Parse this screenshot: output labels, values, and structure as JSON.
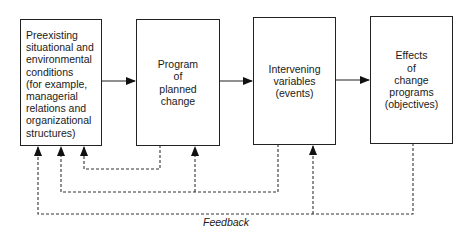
{
  "diagram": {
    "type": "flowchart",
    "boxes": [
      {
        "id": "preexisting-conditions",
        "label": "Preexisting\nsituational and\nenvironmental\n  conditions\n  (for example,\n  managerial\n  relations and\n  organizational\n  structures)"
      },
      {
        "id": "program-of-planned-change",
        "label": "Program\nof\nplanned\nchange"
      },
      {
        "id": "intervening-variables",
        "label": "Intervening\nvariables\n(events)"
      },
      {
        "id": "effects-of-change-programs",
        "label": "Effects\nof\nchange\nprograms\n(objectives)"
      }
    ],
    "forward_arrows": [
      {
        "from": "preexisting-conditions",
        "to": "program-of-planned-change"
      },
      {
        "from": "program-of-planned-change",
        "to": "intervening-variables"
      },
      {
        "from": "intervening-variables",
        "to": "effects-of-change-programs"
      }
    ],
    "feedback_loops": [
      {
        "from": "program-of-planned-change",
        "to": [
          "preexisting-conditions"
        ],
        "style": "dashed"
      },
      {
        "from": "intervening-variables",
        "to": [
          "preexisting-conditions",
          "program-of-planned-change"
        ],
        "style": "dashed"
      },
      {
        "from": "effects-of-change-programs",
        "to": [
          "preexisting-conditions",
          "intervening-variables"
        ],
        "style": "dashed"
      }
    ],
    "feedback_label": "Feedback"
  }
}
